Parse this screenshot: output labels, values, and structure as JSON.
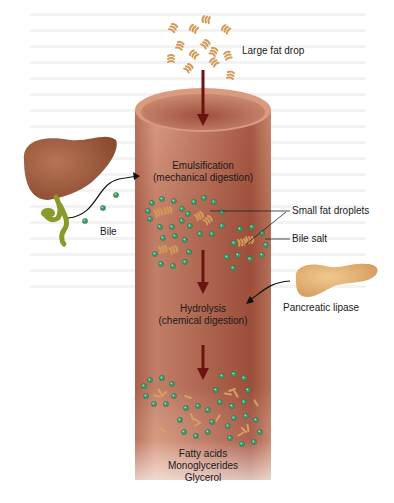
{
  "figure": {
    "labels": {
      "large_fat_drop": "Large fat drop",
      "emulsification_line1": "Emulsification",
      "emulsification_line2": "(mechanical digestion)",
      "bile": "Bile",
      "small_fat_droplets": "Small fat droplets",
      "bile_salt": "Bile salt",
      "hydrolysis_line1": "Hydrolysis",
      "hydrolysis_line2": "(chemical digestion)",
      "pancreatic_lipase": "Pancreatic lipase",
      "product_1": "Fatty acids",
      "product_2": "Monoglycerides",
      "product_3": "Glycerol"
    },
    "organs": [
      "liver",
      "gallbladder",
      "pancreas",
      "small-intestine"
    ],
    "colors": {
      "tube": "#c8836a",
      "tube_dark": "#9a4a38",
      "arrow": "#6b1212",
      "fat": "#d9a066",
      "bile_salt": "#3f9a6a",
      "liver": "#9b5a3c",
      "gallbladder": "#8a9a2a",
      "pancreas": "#e0b070"
    }
  }
}
